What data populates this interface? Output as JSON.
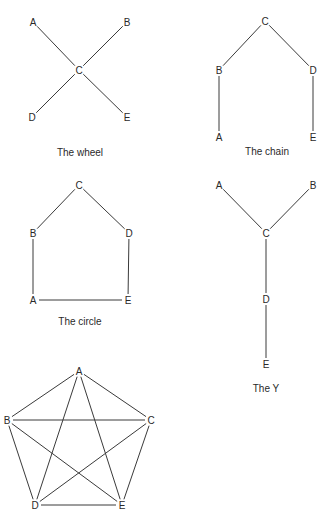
{
  "diagrams": [
    {
      "id": "wheel",
      "caption": "The wheel",
      "caption_pos": [
        80,
        152
      ],
      "nodes": [
        {
          "label": "A",
          "x": 33,
          "y": 22
        },
        {
          "label": "B",
          "x": 127,
          "y": 22
        },
        {
          "label": "C",
          "x": 79,
          "y": 70
        },
        {
          "label": "D",
          "x": 32,
          "y": 117
        },
        {
          "label": "E",
          "x": 127,
          "y": 117
        }
      ],
      "edges": [
        [
          "A",
          "C"
        ],
        [
          "B",
          "C"
        ],
        [
          "D",
          "C"
        ],
        [
          "E",
          "C"
        ]
      ]
    },
    {
      "id": "chain",
      "caption": "The chain",
      "caption_pos": [
        267,
        151
      ],
      "nodes": [
        {
          "label": "C",
          "x": 265,
          "y": 21
        },
        {
          "label": "B",
          "x": 219,
          "y": 70
        },
        {
          "label": "D",
          "x": 313,
          "y": 70
        },
        {
          "label": "A",
          "x": 219,
          "y": 137
        },
        {
          "label": "E",
          "x": 313,
          "y": 137
        }
      ],
      "edges": [
        [
          "A",
          "B"
        ],
        [
          "B",
          "C"
        ],
        [
          "C",
          "D"
        ],
        [
          "D",
          "E"
        ]
      ]
    },
    {
      "id": "circle",
      "caption": "The circle",
      "caption_pos": [
        80,
        321
      ],
      "nodes": [
        {
          "label": "C",
          "x": 79,
          "y": 185
        },
        {
          "label": "B",
          "x": 33,
          "y": 233
        },
        {
          "label": "D",
          "x": 129,
          "y": 233
        },
        {
          "label": "A",
          "x": 33,
          "y": 300
        },
        {
          "label": "E",
          "x": 128,
          "y": 300
        }
      ],
      "edges": [
        [
          "A",
          "B"
        ],
        [
          "B",
          "C"
        ],
        [
          "C",
          "D"
        ],
        [
          "D",
          "E"
        ],
        [
          "E",
          "A"
        ]
      ]
    },
    {
      "id": "y",
      "caption": "The Y",
      "caption_pos": [
        266,
        388
      ],
      "nodes": [
        {
          "label": "A",
          "x": 219,
          "y": 185
        },
        {
          "label": "B",
          "x": 313,
          "y": 185
        },
        {
          "label": "C",
          "x": 266,
          "y": 233
        },
        {
          "label": "D",
          "x": 266,
          "y": 299
        },
        {
          "label": "E",
          "x": 266,
          "y": 364
        }
      ],
      "edges": [
        [
          "A",
          "C"
        ],
        [
          "B",
          "C"
        ],
        [
          "C",
          "D"
        ],
        [
          "D",
          "E"
        ]
      ]
    },
    {
      "id": "all-channel",
      "caption": "",
      "caption_pos": null,
      "nodes": [
        {
          "label": "A",
          "x": 79,
          "y": 371
        },
        {
          "label": "B",
          "x": 7,
          "y": 420
        },
        {
          "label": "C",
          "x": 151,
          "y": 420
        },
        {
          "label": "D",
          "x": 35,
          "y": 505
        },
        {
          "label": "E",
          "x": 122,
          "y": 505
        }
      ],
      "edges": [
        [
          "A",
          "B"
        ],
        [
          "A",
          "C"
        ],
        [
          "A",
          "D"
        ],
        [
          "A",
          "E"
        ],
        [
          "B",
          "C"
        ],
        [
          "B",
          "D"
        ],
        [
          "B",
          "E"
        ],
        [
          "C",
          "D"
        ],
        [
          "C",
          "E"
        ],
        [
          "D",
          "E"
        ]
      ]
    }
  ],
  "style": {
    "edge_color": "#3a3a3a",
    "text_color": "#2a2a2a",
    "background": "#ffffff"
  }
}
